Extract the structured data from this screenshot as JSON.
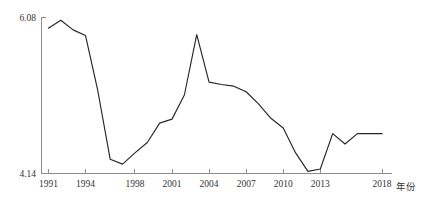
{
  "chart_data": {
    "type": "line",
    "title": "",
    "subtitle": "",
    "xlabel": "年份",
    "ylabel": "",
    "xlim": [
      1990.4,
      2018.8
    ],
    "ylim": [
      4.14,
      6.08
    ],
    "grid": false,
    "legend": null,
    "legend_position": "none",
    "x_tick_labels": [
      "1991",
      "1994",
      "1998",
      "2001",
      "2004",
      "2007",
      "2010",
      "2013",
      "2018"
    ],
    "x_tick_values": [
      1991,
      1994,
      1998,
      2001,
      2004,
      2007,
      2010,
      2013,
      2018
    ],
    "y_tick_labels": [
      "4.14",
      "6.08"
    ],
    "y_tick_values": [
      4.14,
      6.08
    ],
    "series": [
      {
        "name": "",
        "color": "#262626",
        "x": [
          1991,
          1992,
          1993,
          1994,
          1995,
          1996,
          1997,
          1998,
          1999,
          2000,
          2001,
          2002,
          2003,
          2004,
          2005,
          2006,
          2007,
          2008,
          2009,
          2010,
          2011,
          2012,
          2013,
          2014,
          2015,
          2016,
          2017,
          2018
        ],
        "values": [
          5.94,
          6.04,
          5.92,
          5.85,
          5.16,
          4.31,
          4.25,
          4.39,
          4.52,
          4.76,
          4.81,
          5.11,
          5.86,
          5.27,
          5.24,
          5.22,
          5.15,
          5.0,
          4.82,
          4.7,
          4.39,
          4.16,
          4.19,
          4.63,
          4.5,
          4.63,
          4.63,
          4.63
        ]
      }
    ]
  },
  "axis": {
    "x_title": "年份",
    "y_top_label": "6.08",
    "y_bottom_label": "4.14"
  },
  "colors": {
    "line": "#262626",
    "axis": "#8d8d8d",
    "text": "#333333",
    "background": "#ffffff"
  }
}
